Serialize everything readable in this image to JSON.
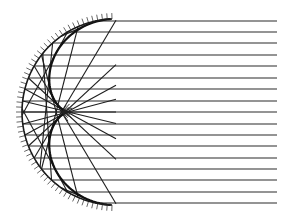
{
  "diagram": {
    "title": "",
    "type": "spherical-mirror-ray-diagram",
    "colors": {
      "background": "#ffffff",
      "ink": "#1e1e1e",
      "hatch": "#555555"
    },
    "mirror": {
      "shape": "concave-spherical-arc",
      "center": [
        115,
        112
      ],
      "radius": 93,
      "top_end": [
        112,
        19
      ],
      "bottom_end": [
        112,
        205
      ],
      "hatch_count": 60,
      "hatch_length": 6
    },
    "focus": [
      62,
      112
    ],
    "incident_rays": {
      "count": 17,
      "x_start": 277,
      "y_values": [
        21,
        32,
        43,
        55,
        66,
        78,
        89,
        101,
        112,
        124,
        135,
        146,
        158,
        169,
        180,
        192,
        203
      ]
    },
    "caustic": {
      "visible": true
    }
  }
}
